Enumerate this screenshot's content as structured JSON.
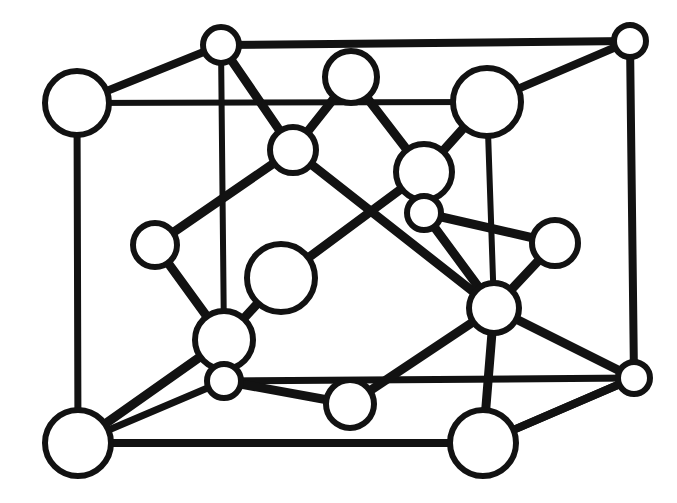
{
  "figure": {
    "kind": "crystal-structure-unit-cell-diagram",
    "background_color": "#ffffff",
    "line_color": "#121212",
    "atom_fill_color": "#ffffff",
    "canvas": {
      "width": 677,
      "height": 503
    }
  },
  "geometry": {
    "atoms": [
      {
        "id": "a1",
        "name": "corner-atom-front-top-left",
        "cx": 77,
        "cy": 103,
        "r": 32,
        "stroke": 6,
        "size": "large"
      },
      {
        "id": "a2",
        "name": "corner-atom-back-top-left",
        "cx": 221,
        "cy": 45,
        "r": 18,
        "stroke": 6,
        "size": "small"
      },
      {
        "id": "a3",
        "name": "corner-atom-back-top-right",
        "cx": 630,
        "cy": 41,
        "r": 16,
        "stroke": 6,
        "size": "small"
      },
      {
        "id": "a4",
        "name": "corner-atom-front-bottom-left",
        "cx": 78,
        "cy": 443,
        "r": 33,
        "stroke": 6,
        "size": "large"
      },
      {
        "id": "a5",
        "name": "corner-atom-front-bottom-right",
        "cx": 483,
        "cy": 443,
        "r": 33,
        "stroke": 6,
        "size": "large"
      },
      {
        "id": "a6",
        "name": "corner-atom-back-bottom-right",
        "cx": 634,
        "cy": 378,
        "r": 16,
        "stroke": 6,
        "size": "small"
      },
      {
        "id": "a7",
        "name": "face-atom-top-center",
        "cx": 351,
        "cy": 77,
        "r": 26,
        "stroke": 6,
        "size": "medium"
      },
      {
        "id": "a8",
        "name": "face-atom-top-right-large",
        "cx": 487,
        "cy": 102,
        "r": 34,
        "stroke": 6,
        "size": "large"
      },
      {
        "id": "a9",
        "name": "interior-atom-upper-left",
        "cx": 293,
        "cy": 150,
        "r": 23,
        "stroke": 6,
        "size": "medium"
      },
      {
        "id": "a10",
        "name": "interior-atom-center-upper",
        "cx": 424,
        "cy": 172,
        "r": 28,
        "stroke": 6,
        "size": "medium"
      },
      {
        "id": "a11",
        "name": "interior-atom-center-small",
        "cx": 424,
        "cy": 213,
        "r": 17,
        "stroke": 6,
        "size": "small"
      },
      {
        "id": "a12",
        "name": "edge-atom-mid-left",
        "cx": 155,
        "cy": 245,
        "r": 22,
        "stroke": 6,
        "size": "medium"
      },
      {
        "id": "a13",
        "name": "edge-atom-mid-right",
        "cx": 555,
        "cy": 243,
        "r": 23,
        "stroke": 6,
        "size": "medium"
      },
      {
        "id": "a14",
        "name": "interior-atom-center-left-large",
        "cx": 281,
        "cy": 278,
        "r": 34,
        "stroke": 6,
        "size": "large"
      },
      {
        "id": "a15",
        "name": "interior-atom-center-right",
        "cx": 494,
        "cy": 308,
        "r": 25,
        "stroke": 6,
        "size": "medium"
      },
      {
        "id": "a16",
        "name": "interior-atom-lower-left",
        "cx": 224,
        "cy": 340,
        "r": 29,
        "stroke": 6,
        "size": "medium"
      },
      {
        "id": "a17",
        "name": "interior-atom-lower-left-small",
        "cx": 224,
        "cy": 381,
        "r": 17,
        "stroke": 6,
        "size": "small"
      },
      {
        "id": "a18",
        "name": "face-atom-bottom-center",
        "cx": 350,
        "cy": 404,
        "r": 24,
        "stroke": 6,
        "size": "medium"
      }
    ],
    "bonds": [
      {
        "name": "cell-edge-top-front",
        "from": "a1",
        "to": "a8",
        "width": 6,
        "kind": "cell-edge"
      },
      {
        "name": "cell-edge-top-back",
        "from": "a2",
        "to": "a3",
        "width": 8,
        "kind": "cell-edge"
      },
      {
        "name": "cell-edge-top-left-depth",
        "from": "a1",
        "to": "a2",
        "width": 8,
        "kind": "cell-edge"
      },
      {
        "name": "cell-edge-top-right-depth",
        "from": "a8",
        "to": "a3",
        "width": 8,
        "kind": "cell-edge"
      },
      {
        "name": "cell-edge-left-vertical",
        "from": "a1",
        "to": "a4",
        "width": 7,
        "kind": "cell-edge"
      },
      {
        "name": "cell-edge-back-left-vert",
        "from": "a2",
        "to": "a16",
        "width": 6,
        "kind": "cell-edge"
      },
      {
        "name": "cell-edge-right-vertical",
        "from": "a8",
        "to": "a15",
        "width": 6,
        "kind": "cell-edge"
      },
      {
        "name": "cell-edge-back-right-vert",
        "from": "a3",
        "to": "a6",
        "width": 8,
        "kind": "cell-edge"
      },
      {
        "name": "cell-edge-bottom-front",
        "from": "a4",
        "to": "a5",
        "width": 8,
        "kind": "cell-edge"
      },
      {
        "name": "cell-edge-bottom-back",
        "from": "a17",
        "to": "a6",
        "width": 7,
        "kind": "cell-edge"
      },
      {
        "name": "cell-edge-bottom-left-depth",
        "from": "a4",
        "to": "a17",
        "width": 7,
        "kind": "cell-edge"
      },
      {
        "name": "cell-edge-bottom-right-dep",
        "from": "a5",
        "to": "a6",
        "width": 8,
        "kind": "cell-edge"
      },
      {
        "name": "bond-a2-a9",
        "from": "a2",
        "to": "a9",
        "width": 9,
        "kind": "bond"
      },
      {
        "name": "bond-a7-a9",
        "from": "a7",
        "to": "a9",
        "width": 9,
        "kind": "bond"
      },
      {
        "name": "bond-a7-a10",
        "from": "a7",
        "to": "a10",
        "width": 9,
        "kind": "bond"
      },
      {
        "name": "bond-a8-a10",
        "from": "a8",
        "to": "a10",
        "width": 9,
        "kind": "bond"
      },
      {
        "name": "bond-a9-a12",
        "from": "a9",
        "to": "a12",
        "width": 9,
        "kind": "bond"
      },
      {
        "name": "bond-a9-a15",
        "from": "a9",
        "to": "a15",
        "width": 9,
        "kind": "bond"
      },
      {
        "name": "bond-a10-a11",
        "from": "a10",
        "to": "a11",
        "width": 9,
        "kind": "bond"
      },
      {
        "name": "bond-a11-a13",
        "from": "a11",
        "to": "a13",
        "width": 9,
        "kind": "bond"
      },
      {
        "name": "bond-a11-a15",
        "from": "a11",
        "to": "a15",
        "width": 9,
        "kind": "bond"
      },
      {
        "name": "bond-a12-a16",
        "from": "a12",
        "to": "a16",
        "width": 9,
        "kind": "bond"
      },
      {
        "name": "bond-a13-a15",
        "from": "a13",
        "to": "a15",
        "width": 9,
        "kind": "bond"
      },
      {
        "name": "bond-a14-a16",
        "from": "a14",
        "to": "a16",
        "width": 9,
        "kind": "bond"
      },
      {
        "name": "bond-a14-a10",
        "from": "a14",
        "to": "a10",
        "width": 9,
        "kind": "bond"
      },
      {
        "name": "bond-a16-a17",
        "from": "a16",
        "to": "a17",
        "width": 9,
        "kind": "bond"
      },
      {
        "name": "bond-a16-a4",
        "from": "a16",
        "to": "a4",
        "width": 9,
        "kind": "bond"
      },
      {
        "name": "bond-a17-a18",
        "from": "a17",
        "to": "a18",
        "width": 9,
        "kind": "bond"
      },
      {
        "name": "bond-a18-a15",
        "from": "a18",
        "to": "a15",
        "width": 9,
        "kind": "bond"
      },
      {
        "name": "bond-a15-a5",
        "from": "a15",
        "to": "a5",
        "width": 9,
        "kind": "bond"
      },
      {
        "name": "bond-a15-a6",
        "from": "a15",
        "to": "a6",
        "width": 9,
        "kind": "bond"
      },
      {
        "name": "bond-a5-a6-diagonal",
        "from": "a5",
        "to": "a6",
        "width": 8,
        "kind": "bond"
      }
    ]
  }
}
